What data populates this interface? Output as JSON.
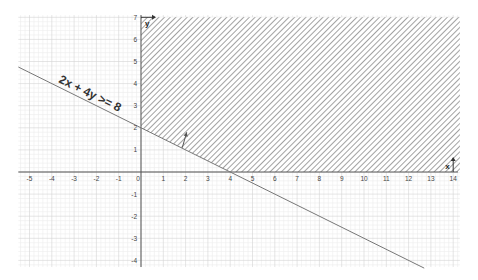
{
  "chart_data": {
    "type": "inequality-plot",
    "title": "",
    "equation_label": "2x + 4y >= 8",
    "boundary_line": {
      "a": 2,
      "b": 4,
      "c": 8,
      "form": "2x + 4y = 8",
      "x_intercept": 4,
      "y_intercept": 2
    },
    "shaded_region": {
      "description": "hatched region above boundary line, x >= 0",
      "x_range": [
        0,
        14.3
      ],
      "y_range": [
        0,
        7
      ]
    },
    "normal_arrow": {
      "from": [
        1.85,
        1.1
      ],
      "to": [
        2.05,
        1.8
      ]
    },
    "axes": {
      "x_label": "x",
      "y_label": "y",
      "xlim": [
        -5.5,
        14.3
      ],
      "ylim": [
        -4.3,
        7.1
      ],
      "x_ticks": [
        -5,
        -4,
        -3,
        -2,
        -1,
        0,
        1,
        2,
        3,
        4,
        5,
        6,
        7,
        8,
        9,
        10,
        11,
        12,
        13,
        14
      ],
      "y_ticks": [
        -4,
        -3,
        -2,
        -1,
        1,
        2,
        3,
        4,
        5,
        6,
        7
      ]
    },
    "grid": true,
    "colors": {
      "line": "#777777",
      "hatch": "#8a8a8a",
      "axis": "#555555",
      "grid_major": "#d4d4d4",
      "grid_minor": "#ececec"
    }
  }
}
